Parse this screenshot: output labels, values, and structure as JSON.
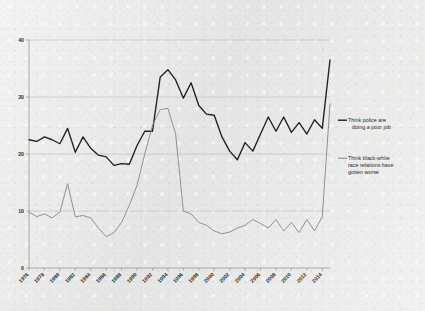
{
  "figure": {
    "background_color": "#ececeb",
    "series_colors": {
      "police": "#231f20",
      "race": "#8c8c8c"
    },
    "grid_color": "#b4b4b4"
  },
  "legend": {
    "position": "right",
    "entries": [
      {
        "key": "police",
        "line1": "Think police are",
        "line2": "doing a poor job",
        "full": "Think police are doing a poor job",
        "swatch": "line-swatch-icon"
      },
      {
        "key": "race",
        "line1": "Think black-white",
        "line2": "race relations have",
        "line3": "gotten worse",
        "full": "Think black-white race relations have gotten worse",
        "swatch": "line-swatch-icon"
      }
    ]
  },
  "chart_data": {
    "type": "line",
    "title": "",
    "subtitle": "",
    "xlabel": "",
    "ylabel": "",
    "xlim": [
      1976,
      2015
    ],
    "ylim": [
      0,
      40
    ],
    "yticks": [
      0,
      10,
      20,
      30,
      40
    ],
    "ytick_labels": [
      "0",
      "10",
      "20",
      "30",
      "40"
    ],
    "xticks": [
      1976,
      1978,
      1980,
      1982,
      1984,
      1986,
      1988,
      1990,
      1992,
      1994,
      1996,
      1998,
      2000,
      2002,
      2004,
      2006,
      2008,
      2010,
      2012,
      2014
    ],
    "xtick_labels": [
      "1976",
      "1978",
      "1980",
      "1982",
      "1984",
      "1986",
      "1988",
      "1990",
      "1992",
      "1994",
      "1996",
      "1998",
      "2000",
      "2002",
      "2004",
      "2006",
      "2008",
      "2010",
      "2012",
      "2014"
    ],
    "xtick_rotation": 45,
    "grid": "horizontal",
    "legend_position": "right",
    "x": [
      1976,
      1977,
      1978,
      1979,
      1980,
      1981,
      1982,
      1983,
      1984,
      1985,
      1986,
      1987,
      1988,
      1989,
      1990,
      1991,
      1992,
      1993,
      1994,
      1995,
      1996,
      1997,
      1998,
      1999,
      2000,
      2001,
      2002,
      2003,
      2004,
      2005,
      2006,
      2007,
      2008,
      2009,
      2010,
      2011,
      2012,
      2013,
      2014,
      2015
    ],
    "series": [
      {
        "name": "Think police are doing a poor job",
        "key": "police",
        "color": "#231f20",
        "values": [
          22.5,
          22.2,
          23.0,
          22.5,
          21.8,
          24.5,
          20.3,
          23.0,
          21.0,
          19.8,
          19.5,
          18.0,
          18.3,
          18.2,
          21.5,
          24.0,
          24.0,
          33.5,
          34.8,
          33.0,
          29.8,
          32.5,
          28.5,
          27.0,
          26.8,
          23.0,
          20.5,
          19.0,
          22.0,
          20.5,
          23.5,
          26.5,
          24.0,
          26.5,
          23.8,
          25.5,
          23.5,
          26.0,
          24.5,
          36.5
        ]
      },
      {
        "name": "Think black-white race relations have gotten worse",
        "key": "race",
        "color": "#8c8c8c",
        "values": [
          9.8,
          9.0,
          9.5,
          8.8,
          9.8,
          14.8,
          9.0,
          9.2,
          8.8,
          7.0,
          5.5,
          6.2,
          8.0,
          11.0,
          14.5,
          20.0,
          25.0,
          27.8,
          28.0,
          23.5,
          10.0,
          9.5,
          8.0,
          7.5,
          6.5,
          6.0,
          6.3,
          7.0,
          7.5,
          8.5,
          7.8,
          7.0,
          8.5,
          6.5,
          8.0,
          6.2,
          8.5,
          6.5,
          9.0,
          28.8
        ]
      }
    ]
  }
}
